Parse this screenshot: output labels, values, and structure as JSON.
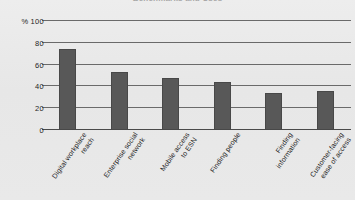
{
  "chart_data": {
    "type": "bar",
    "title": "Benchmarks and Uses",
    "xlabel": "",
    "ylabel": "%",
    "ylim": [
      0,
      100
    ],
    "yticks": [
      0,
      20,
      40,
      60,
      80,
      100
    ],
    "ytick_labels": [
      "0",
      "20",
      "40",
      "60",
      "80",
      "100"
    ],
    "y_axis_unit": "%",
    "grid": true,
    "legend": "none",
    "bar_color": "#585858",
    "background_color": "#e9e9e9",
    "gridline_color": "#6a6a6a",
    "categories": [
      "Digital workplace reach",
      "Enterprise social network",
      "Mobile access to ESN",
      "Finding people",
      "Finding information",
      "Customer-facing ease of access"
    ],
    "category_lines": [
      [
        "Digital workplace",
        "reach"
      ],
      [
        "Enterprise social",
        "network"
      ],
      [
        "Mobile access",
        "to ESN"
      ],
      [
        "Finding people",
        ""
      ],
      [
        "Finding",
        "information"
      ],
      [
        "Customer-facing",
        "ease of access"
      ]
    ],
    "values": [
      74,
      53,
      48,
      44,
      34,
      36
    ]
  }
}
